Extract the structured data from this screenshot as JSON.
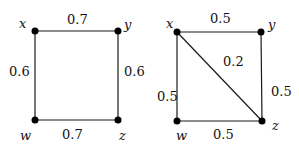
{
  "graphs": [
    {
      "name": "left-graph",
      "nodes": {
        "x": {
          "label": "x",
          "cx": 35,
          "cy": 31
        },
        "y": {
          "label": "y",
          "cx": 118,
          "cy": 31
        },
        "w": {
          "label": "w",
          "cx": 35,
          "cy": 120
        },
        "z": {
          "label": "z",
          "cx": 118,
          "cy": 120
        }
      },
      "edges": {
        "xy": {
          "from": "x",
          "to": "y",
          "weight": "0.7"
        },
        "xw": {
          "from": "x",
          "to": "w",
          "weight": "0.6"
        },
        "yz": {
          "from": "y",
          "to": "z",
          "weight": "0.6"
        },
        "wz": {
          "from": "w",
          "to": "z",
          "weight": "0.7"
        }
      }
    },
    {
      "name": "right-graph",
      "nodes": {
        "x": {
          "label": "x",
          "cx": 177,
          "cy": 32
        },
        "y": {
          "label": "y",
          "cx": 261,
          "cy": 32
        },
        "w": {
          "label": "w",
          "cx": 177,
          "cy": 121
        },
        "z": {
          "label": "z",
          "cx": 262,
          "cy": 121
        }
      },
      "edges": {
        "xy": {
          "from": "x",
          "to": "y",
          "weight": "0.5"
        },
        "xw": {
          "from": "x",
          "to": "w",
          "weight": "0.5"
        },
        "yz": {
          "from": "y",
          "to": "z",
          "weight": "0.5"
        },
        "wz": {
          "from": "w",
          "to": "z",
          "weight": "0.5"
        },
        "xz": {
          "from": "x",
          "to": "z",
          "weight": "0.2"
        }
      }
    }
  ]
}
